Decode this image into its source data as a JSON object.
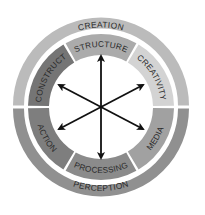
{
  "diagram": {
    "type": "concentric-ring-cycle",
    "center": {
      "x": 101,
      "y": 107
    },
    "outer_ring": {
      "segments": [
        {
          "label": "CREATION",
          "position": "top",
          "color": "#b9b9b9"
        },
        {
          "label": "PERCEPTION",
          "position": "bottom",
          "color": "#8f8f8f"
        }
      ]
    },
    "inner_ring": {
      "segments": [
        {
          "label": "STRUCTURE",
          "position": "top",
          "color": "#aaaaaa"
        },
        {
          "label": "CREATIVITY",
          "position": "upper-right",
          "color": "#d2d2d2"
        },
        {
          "label": "MEDIA",
          "position": "lower-right",
          "color": "#a0a0a0"
        },
        {
          "label": "PROCESSING",
          "position": "bottom",
          "color": "#8a8a8a"
        },
        {
          "label": "ACTION",
          "position": "lower-left",
          "color": "#7d7d7d"
        },
        {
          "label": "CONSTRUCT",
          "position": "upper-left",
          "color": "#747474"
        }
      ]
    },
    "center_arrows": {
      "count": 6,
      "style": "double-headed",
      "directions": [
        "up",
        "upper-right",
        "lower-right",
        "down",
        "lower-left",
        "upper-left"
      ],
      "color": "#111111"
    }
  }
}
